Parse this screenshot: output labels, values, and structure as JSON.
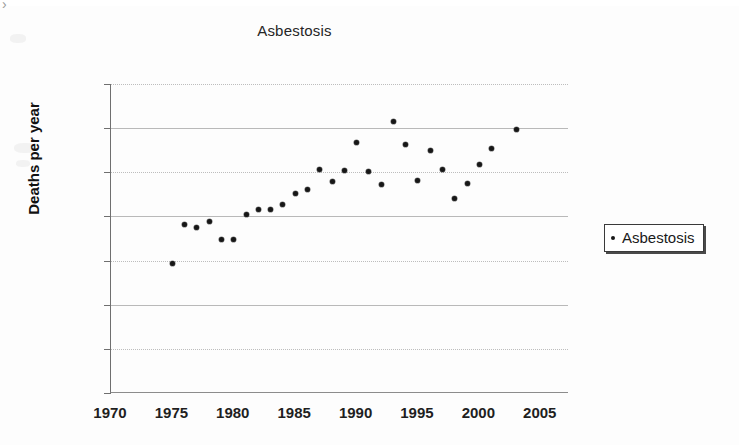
{
  "chart_data": {
    "type": "scatter",
    "title": "Asbestosis",
    "xlabel": "",
    "ylabel": "Deaths per year",
    "xlim": [
      1970,
      2007.3
    ],
    "ylim": [
      0,
      350
    ],
    "grid": true,
    "legend_position": "right",
    "series": [
      {
        "name": "Asbestosis",
        "marker": "dot",
        "color": "#171717",
        "x": [
          1975,
          1976,
          1977,
          1978,
          1979,
          1980,
          1981,
          1982,
          1983,
          1984,
          1985,
          1986,
          1987,
          1988,
          1989,
          1990,
          1991,
          1992,
          1993,
          1994,
          1995,
          1996,
          1997,
          1998,
          1999,
          2000,
          2001,
          2003
        ],
        "y": [
          147,
          191,
          187,
          194,
          174,
          174,
          202,
          208,
          208,
          214,
          226,
          231,
          253,
          240,
          252,
          284,
          251,
          236,
          308,
          282,
          241,
          275,
          253,
          220,
          237,
          259,
          277,
          299
        ]
      }
    ],
    "xticks": [
      1970,
      1975,
      1980,
      1985,
      1990,
      1995,
      2000,
      2005
    ],
    "yticks": [
      0,
      50,
      100,
      150,
      200,
      250,
      300,
      350
    ]
  },
  "legend": {
    "entries": [
      {
        "label": "Asbestosis"
      }
    ]
  }
}
